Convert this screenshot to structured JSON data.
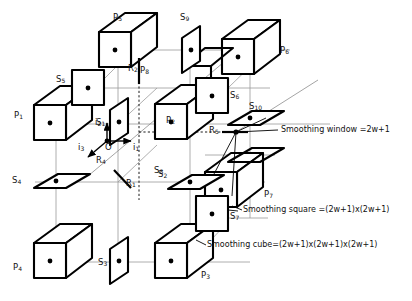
{
  "figure": {
    "type": "3d-lattice-sampling-diagram",
    "stroke_color": "#000000",
    "thin_line_color": "#8a8a8a",
    "background": "#ffffff"
  },
  "axes": {
    "origin_label": "O",
    "items": [
      {
        "name": "axis-i1",
        "label": "i",
        "sub": "1",
        "direction": "right"
      },
      {
        "name": "axis-i2",
        "label": "i",
        "sub": "2",
        "direction": "up"
      },
      {
        "name": "axis-i3",
        "label": "i",
        "sub": "3",
        "direction": "down-left"
      }
    ]
  },
  "cubes": [
    {
      "id": "P1",
      "letter": "P",
      "sub": "1",
      "label_x": 14,
      "label_y": 115
    },
    {
      "id": "P2",
      "letter": "P",
      "sub": "2",
      "label_x": 168,
      "label_y": 120
    },
    {
      "id": "P3",
      "letter": "P",
      "sub": "3",
      "label_x": 203,
      "label_y": 275
    },
    {
      "id": "P4",
      "letter": "P",
      "sub": "4",
      "label_x": 13,
      "label_y": 267
    },
    {
      "id": "P5",
      "letter": "P",
      "sub": "5",
      "label_x": 115,
      "label_y": 17
    },
    {
      "id": "P6",
      "letter": "P",
      "sub": "6",
      "label_x": 272,
      "label_y": 50
    },
    {
      "id": "P7",
      "letter": "P",
      "sub": "7",
      "label_x": 259,
      "label_y": 198
    },
    {
      "id": "P8",
      "letter": "P",
      "sub": "8",
      "label_x": 143,
      "label_y": 71
    }
  ],
  "squares": [
    {
      "id": "S1",
      "letter": "S",
      "sub": "1",
      "label_x": 97,
      "label_y": 120
    },
    {
      "id": "S2",
      "letter": "S",
      "sub": "2",
      "label_x": 160,
      "label_y": 171
    },
    {
      "id": "S3",
      "letter": "S",
      "sub": "3",
      "label_x": 99,
      "label_y": 262
    },
    {
      "id": "S4",
      "letter": "S",
      "sub": "4",
      "label_x": 14,
      "label_y": 180
    },
    {
      "id": "S5",
      "letter": "S",
      "sub": "5",
      "label_x": 58,
      "label_y": 79
    },
    {
      "id": "S6",
      "letter": "S",
      "sub": "6",
      "label_x": 232,
      "label_y": 95
    },
    {
      "id": "S7",
      "letter": "S",
      "sub": "7",
      "label_x": 236,
      "label_y": 216
    },
    {
      "id": "S8",
      "letter": "S",
      "sub": "8",
      "label_x": 160,
      "label_y": 171
    },
    {
      "id": "S9",
      "letter": "S",
      "sub": "9",
      "label_x": 182,
      "label_y": 17
    },
    {
      "id": "S10",
      "letter": "S",
      "sub": "10",
      "label_x": 251,
      "label_y": 106
    }
  ],
  "points": [
    {
      "id": "R1",
      "letter": "R",
      "sub": "1",
      "label_x": 127,
      "label_y": 183
    },
    {
      "id": "R2",
      "letter": "R",
      "sub": "2",
      "label_x": 142,
      "label_y": 68
    },
    {
      "id": "R4",
      "letter": "R",
      "sub": "4",
      "label_x": 97,
      "label_y": 160
    },
    {
      "id": "R5",
      "letter": "R",
      "sub": "5",
      "label_x": 212,
      "label_y": 130
    }
  ],
  "annotations": [
    {
      "id": "smoothing-window",
      "text": "Smoothing window =2w+1",
      "x": 280,
      "y": 131
    },
    {
      "id": "smoothing-square",
      "text": "Smoothing square =(2w+1)x(2w+1)",
      "x": 242,
      "y": 211
    },
    {
      "id": "smoothing-cube",
      "text": "Smoothing cube=(2w+1)x(2w+1)x(2w+1)",
      "x": 205,
      "y": 246
    }
  ]
}
